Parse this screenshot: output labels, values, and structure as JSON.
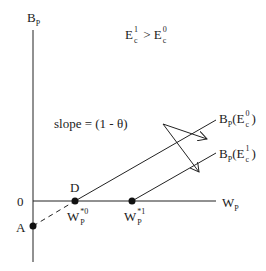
{
  "diagram": {
    "axes": {
      "y_label_main": "B",
      "y_label_sub": "P",
      "x_label_main": "W",
      "x_label_sub": "P",
      "origin_label": "0"
    },
    "condition": {
      "left_main": "E",
      "left_sup": "1",
      "left_sub": "c",
      "operator": ">",
      "right_main": "E",
      "right_sup": "0",
      "right_sub": "c"
    },
    "slope_label": "slope = (1 - θ)",
    "points": {
      "A": "A",
      "D": "D",
      "w0_main": "W",
      "w0_sup": "*0",
      "w0_sub": "P",
      "w1_main": "W",
      "w1_sup": "*1",
      "w1_sub": "P"
    },
    "lines": {
      "e0": {
        "main": "B",
        "sub": "P",
        "paren_open": "(E",
        "sup": "0",
        "csub": "c",
        "paren_close": ")"
      },
      "e1": {
        "main": "B",
        "sub": "P",
        "paren_open": "(E",
        "sup": "1",
        "csub": "c",
        "paren_close": ")"
      }
    },
    "colors": {
      "ink": "#222222",
      "background": "#ffffff"
    }
  }
}
